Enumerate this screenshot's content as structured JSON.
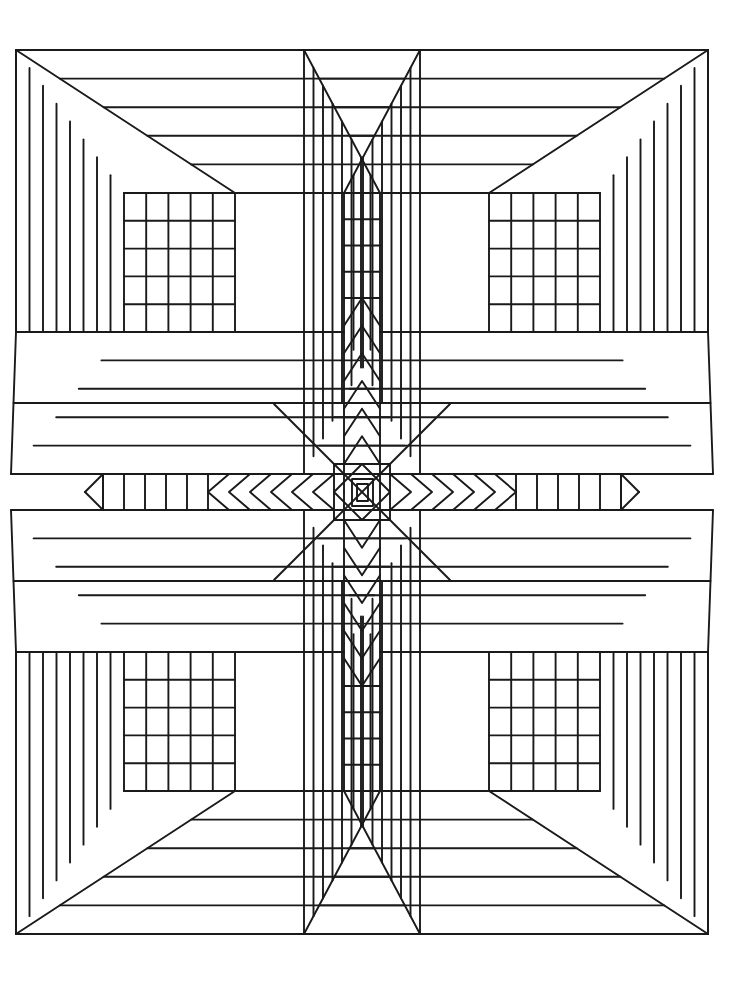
{
  "page": {
    "background_color": "#ffffff",
    "stroke_color": "#1a1a1a",
    "width": 756,
    "height": 983
  },
  "artwork": {
    "name": "four-quadrant-log-cabin-star",
    "description": "Symmetric black-and-white line drawing: four nested perspective-box (log cabin) quadrants joined by a horizontal and a vertical striped band that converge on a small rectangle at the exact center.",
    "symmetry": "4-fold mirror (horizontal and vertical axes)",
    "center_point": {
      "x": 362,
      "y": 492
    },
    "bounds": {
      "left": 11,
      "top": 50,
      "right": 713,
      "bottom": 940
    },
    "stroke_width": 1.9,
    "fill": "none"
  },
  "geometry": {
    "quadrant": {
      "name": "log-cabin-box",
      "outer_corner": {
        "x": 16,
        "y": 50
      },
      "inner_corner": {
        "x": 235,
        "y": 193
      },
      "side_stripes": 7,
      "face_stripes": 4,
      "grid_rows": 5,
      "grid_cols": 5,
      "grid_rect": {
        "x": 124,
        "y": 193,
        "w": 111,
        "h": 139
      }
    },
    "horizontal_band": {
      "name": "center-horizontal-band",
      "tip_x": 103,
      "band_top": 474,
      "band_bottom": 510,
      "cells": 5,
      "chevrons": 6,
      "chevron_direction": "toward-center"
    },
    "vertical_band": {
      "name": "center-vertical-band",
      "tip_y": 193,
      "band_left": 344,
      "band_right": 380,
      "cells": 4,
      "chevrons": 6,
      "chevron_direction": "toward-center"
    },
    "center_motif": {
      "name": "center-rectangle",
      "outer_diamond_halfwidth": 28,
      "rect": {
        "x": 352,
        "y": 479,
        "w": 21,
        "h": 27
      },
      "inner_rect": {
        "x": 357,
        "y": 484,
        "w": 11,
        "h": 17
      }
    }
  }
}
